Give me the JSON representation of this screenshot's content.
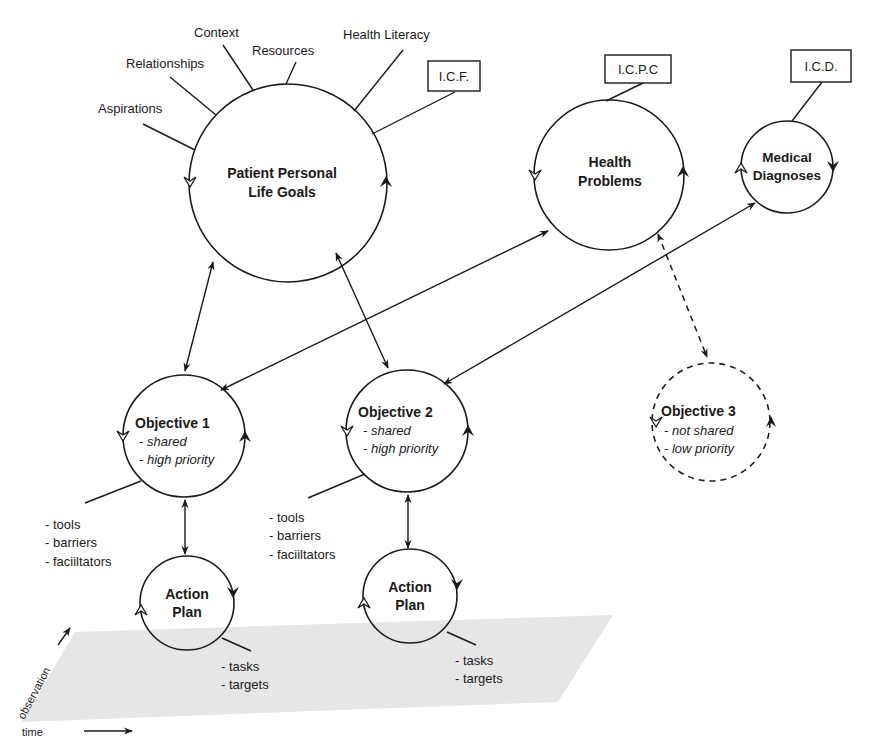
{
  "diagram": {
    "plane": {
      "fill": "#e6e6e6",
      "axis_observation": "observation",
      "axis_time": "time"
    },
    "life_goals": {
      "line1": "Patient Personal",
      "line2": "Life Goals",
      "factors": [
        "Aspirations",
        "Relationships",
        "Context",
        "Resources",
        "Health Literacy"
      ],
      "classification": "I.C.F."
    },
    "health_problems": {
      "line1": "Health",
      "line2": "Problems",
      "classification": "I.C.P.C"
    },
    "medical_diagnoses": {
      "line1": "Medical",
      "line2": "Diagnoses",
      "classification": "I.C.D."
    },
    "objectives": [
      {
        "title": "Objective 1",
        "attr1": "- shared",
        "attr2": "- high priority",
        "style": "solid"
      },
      {
        "title": "Objective 2",
        "attr1": "- shared",
        "attr2": "- high priority",
        "style": "solid"
      },
      {
        "title": "Objective 3",
        "attr1": "- not shared",
        "attr2": "- low priority",
        "style": "dashed"
      }
    ],
    "objective_resources": {
      "items": [
        "- tools",
        "- barriers",
        "- faciiltators"
      ]
    },
    "action_plans": [
      {
        "line1": "Action",
        "line2": "Plan",
        "items": [
          "- tasks",
          "- targets"
        ]
      },
      {
        "line1": "Action",
        "line2": "Plan",
        "items": [
          "- tasks",
          "- targets"
        ]
      }
    ]
  }
}
